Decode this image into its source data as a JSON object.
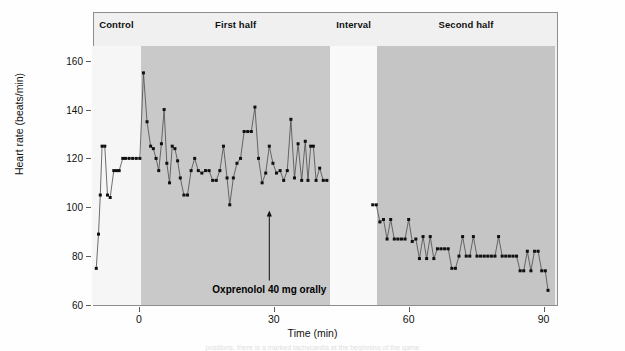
{
  "chart_data": {
    "type": "line",
    "title": "",
    "xlabel": "Time (min)",
    "ylabel": "Heart rate (beats/min)",
    "xlim": [
      -10,
      93
    ],
    "ylim": [
      60,
      166
    ],
    "yticks": [
      60,
      80,
      100,
      120,
      140,
      160
    ],
    "xticks": [
      0,
      30,
      60,
      90
    ],
    "grid": false,
    "legend": "none",
    "marker": "filled-square",
    "line_color": "#4a4a4a",
    "marker_color": "#101010",
    "series": [
      {
        "name": "Heart rate",
        "points": [
          [
            -9.5,
            75
          ],
          [
            -9.0,
            89
          ],
          [
            -8.6,
            105
          ],
          [
            -8.2,
            125
          ],
          [
            -7.6,
            125
          ],
          [
            -7.0,
            105
          ],
          [
            -6.4,
            104
          ],
          [
            -5.6,
            115
          ],
          [
            -5.0,
            115
          ],
          [
            -4.4,
            115
          ],
          [
            -3.6,
            120
          ],
          [
            -3.0,
            120
          ],
          [
            -2.2,
            120
          ],
          [
            -1.4,
            120
          ],
          [
            -0.6,
            120
          ],
          [
            0.2,
            120
          ],
          [
            1.0,
            155
          ],
          [
            1.8,
            135
          ],
          [
            2.6,
            125
          ],
          [
            3.2,
            124
          ],
          [
            3.8,
            120
          ],
          [
            4.4,
            115
          ],
          [
            5.0,
            126
          ],
          [
            5.6,
            140
          ],
          [
            6.2,
            118
          ],
          [
            6.8,
            110
          ],
          [
            7.4,
            125
          ],
          [
            8.0,
            124
          ],
          [
            8.6,
            119
          ],
          [
            9.2,
            112
          ],
          [
            10.0,
            105
          ],
          [
            10.8,
            105
          ],
          [
            11.6,
            115
          ],
          [
            12.4,
            120
          ],
          [
            13.2,
            115
          ],
          [
            14.0,
            114
          ],
          [
            14.8,
            115
          ],
          [
            15.6,
            115
          ],
          [
            16.4,
            111
          ],
          [
            17.2,
            111
          ],
          [
            18.0,
            115
          ],
          [
            18.8,
            125
          ],
          [
            19.6,
            112
          ],
          [
            20.2,
            101
          ],
          [
            21.0,
            112
          ],
          [
            21.8,
            118
          ],
          [
            22.6,
            120
          ],
          [
            23.4,
            131
          ],
          [
            24.2,
            131
          ],
          [
            25.0,
            131
          ],
          [
            25.8,
            141
          ],
          [
            26.6,
            120
          ],
          [
            27.4,
            110
          ],
          [
            28.2,
            114
          ],
          [
            29.0,
            125
          ],
          [
            29.8,
            118
          ],
          [
            30.6,
            114
          ],
          [
            31.4,
            115
          ],
          [
            32.2,
            111
          ],
          [
            33.0,
            115
          ],
          [
            33.8,
            136
          ],
          [
            34.6,
            112
          ],
          [
            35.4,
            126
          ],
          [
            36.2,
            111
          ],
          [
            37.0,
            127
          ],
          [
            37.6,
            111
          ],
          [
            38.2,
            125
          ],
          [
            38.8,
            125
          ],
          [
            39.4,
            111
          ],
          [
            40.2,
            116
          ],
          [
            41.0,
            111
          ],
          [
            41.8,
            111
          ],
          [
            52.0,
            101
          ],
          [
            52.8,
            101
          ],
          [
            53.6,
            94
          ],
          [
            54.4,
            95
          ],
          [
            55.2,
            87
          ],
          [
            56.0,
            95
          ],
          [
            56.8,
            87
          ],
          [
            57.6,
            87
          ],
          [
            58.4,
            87
          ],
          [
            59.2,
            87
          ],
          [
            60.0,
            95
          ],
          [
            60.8,
            86
          ],
          [
            61.6,
            87
          ],
          [
            62.4,
            79
          ],
          [
            63.2,
            88
          ],
          [
            64.0,
            79
          ],
          [
            64.8,
            88
          ],
          [
            65.6,
            79
          ],
          [
            66.4,
            83
          ],
          [
            67.2,
            83
          ],
          [
            68.0,
            83
          ],
          [
            68.8,
            83
          ],
          [
            69.6,
            75
          ],
          [
            70.4,
            75
          ],
          [
            71.2,
            80
          ],
          [
            72.0,
            88
          ],
          [
            72.8,
            80
          ],
          [
            73.6,
            80
          ],
          [
            74.4,
            88
          ],
          [
            75.2,
            80
          ],
          [
            76.0,
            80
          ],
          [
            76.8,
            80
          ],
          [
            77.6,
            80
          ],
          [
            78.4,
            80
          ],
          [
            79.2,
            80
          ],
          [
            80.0,
            88
          ],
          [
            80.8,
            80
          ],
          [
            81.6,
            80
          ],
          [
            82.4,
            80
          ],
          [
            83.2,
            80
          ],
          [
            84.0,
            80
          ],
          [
            84.8,
            74
          ],
          [
            85.6,
            74
          ],
          [
            86.4,
            82
          ],
          [
            87.2,
            74
          ],
          [
            88.0,
            82
          ],
          [
            88.8,
            82
          ],
          [
            89.6,
            74
          ],
          [
            90.4,
            74
          ],
          [
            91.0,
            66
          ]
        ]
      }
    ],
    "annotations": [
      {
        "name": "oxprenolol-dose",
        "text": "Oxprenolol 40 mg orally",
        "arrow_x": 29,
        "arrow_y_from": 70,
        "arrow_y_to": 97
      }
    ],
    "phases": [
      {
        "name": "control",
        "label": "Control",
        "x_start": -10.5,
        "x_end": 0.5,
        "shade": "#f6f6f6"
      },
      {
        "name": "first-half",
        "label": "First half",
        "x_start": 0.5,
        "x_end": 42.5,
        "shade": "#c9c9c9"
      },
      {
        "name": "interval",
        "label": "Interval",
        "x_start": 42.5,
        "x_end": 53.0,
        "shade": "#f9f9f9"
      },
      {
        "name": "second-half",
        "label": "Second half",
        "x_start": 53.0,
        "x_end": 92.5,
        "shade": "#c5c5c5"
      }
    ]
  },
  "figure": {
    "background": "#ffffff",
    "plot_background": "#f1f1f1",
    "frame_color": "#8d8d8d",
    "caption_partial": "positions, there is a marked tachycardia at the beginning of the game"
  }
}
